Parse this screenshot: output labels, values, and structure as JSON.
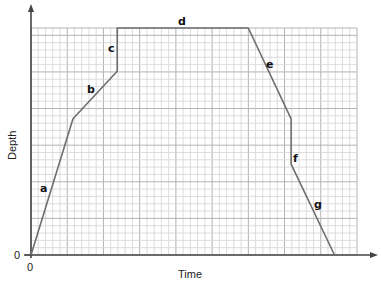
{
  "chart_data": {
    "type": "line",
    "title": "",
    "xlabel": "Time",
    "ylabel": "Depth",
    "x_tick_labels": [
      "0"
    ],
    "y_tick_labels": [
      "0"
    ],
    "grid": true,
    "grid_units": {
      "x_minor_squares": 45,
      "y_minor_squares": 31,
      "major_every": 5
    },
    "xlim": [
      0,
      45
    ],
    "ylim": [
      0,
      31
    ],
    "legend": null,
    "series": [
      {
        "name": "depth-time profile",
        "points": [
          {
            "x": 0,
            "y": 0
          },
          {
            "x": 5.8,
            "y": 18.6
          },
          {
            "x": 11.9,
            "y": 25.1
          },
          {
            "x": 11.9,
            "y": 31.3
          },
          {
            "x": 30.0,
            "y": 31.3
          },
          {
            "x": 35.9,
            "y": 18.6
          },
          {
            "x": 35.9,
            "y": 12.4
          },
          {
            "x": 41.9,
            "y": 0
          }
        ]
      }
    ],
    "segment_labels": [
      {
        "label": "a",
        "segment": "rising steep"
      },
      {
        "label": "b",
        "segment": "rising gentle"
      },
      {
        "label": "c",
        "segment": "vertical rise"
      },
      {
        "label": "d",
        "segment": "horizontal"
      },
      {
        "label": "e",
        "segment": "falling"
      },
      {
        "label": "f",
        "segment": "vertical drop"
      },
      {
        "label": "g",
        "segment": "falling to zero"
      }
    ]
  },
  "colors": {
    "grid_minor": "#d4d4d4",
    "grid_major": "#b3b3b3",
    "axis": "#444444",
    "line": "#6e6e6e",
    "text": "#222222"
  },
  "labels": {
    "xlabel": "Time",
    "ylabel": "Depth",
    "x_origin": "0",
    "y_origin": "0",
    "seg_a": "a",
    "seg_b": "b",
    "seg_c": "c",
    "seg_d": "d",
    "seg_e": "e",
    "seg_f": "f",
    "seg_g": "g"
  }
}
